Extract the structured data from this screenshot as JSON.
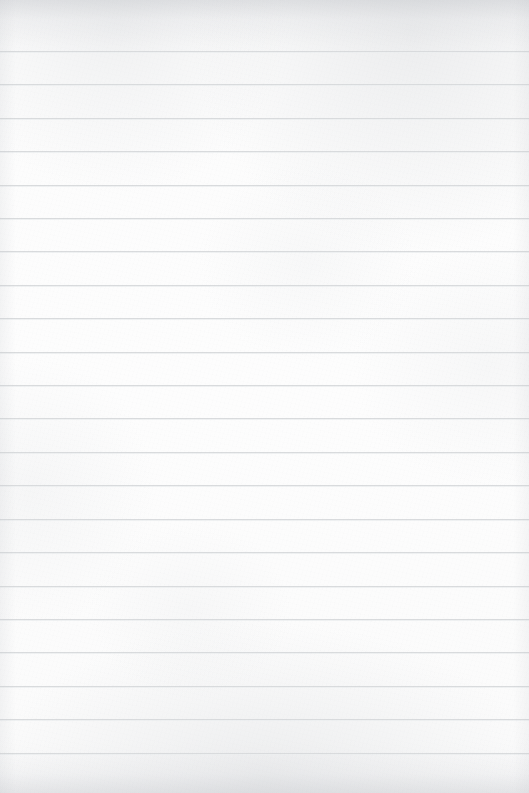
{
  "document": {
    "kind": "blank-ruled-notebook-paper",
    "title": "Blank Ruled Notebook Paper",
    "page_width": 529,
    "page_height": 793,
    "text_content": "",
    "has_handwriting": false,
    "has_printed_text": false,
    "has_margin_line": false,
    "orientation": "portrait"
  },
  "paper": {
    "background_color": "#fbfbfb",
    "edge_tint_color": "#c4c7cb",
    "texture": "subtle mottled scan grain, darker along top and bottom edges"
  },
  "ruling": {
    "line_color": "#d9dbdd",
    "line_highlight_color": "#eceff0",
    "line_thickness_px": 1,
    "first_line_y": 51,
    "spacing_px": 33.43,
    "line_count": 22,
    "extends_full_width": true,
    "line_y_positions": [
      51,
      84,
      118,
      151,
      185,
      218,
      251,
      285,
      318,
      352,
      385,
      418,
      452,
      485,
      519,
      552,
      586,
      619,
      652,
      686,
      719,
      753
    ]
  }
}
